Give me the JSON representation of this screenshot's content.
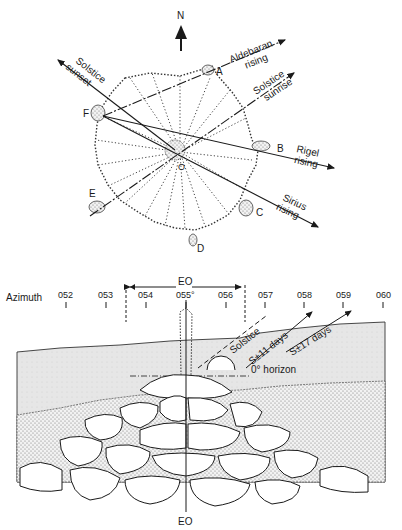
{
  "plan": {
    "north_label": "N",
    "center_label": "O",
    "stones": [
      {
        "id": "A",
        "label": "A"
      },
      {
        "id": "B",
        "label": "B"
      },
      {
        "id": "C",
        "label": "C"
      },
      {
        "id": "D",
        "label": "D"
      },
      {
        "id": "E",
        "label": "E"
      },
      {
        "id": "F",
        "label": "F"
      }
    ],
    "alignments": [
      {
        "name": "aldebaran",
        "line1": "Aldebaran",
        "line2": "rising"
      },
      {
        "name": "solstice-sunrise",
        "line1": "Solstice",
        "line2": "sunrise"
      },
      {
        "name": "solstice-sunset",
        "line1": "Solstice",
        "line2": "sunset"
      },
      {
        "name": "rigel",
        "line1": "Rigel",
        "line2": "rising"
      },
      {
        "name": "sirius",
        "line1": "Sirius",
        "line2": "rising"
      }
    ]
  },
  "elevation": {
    "top_label": "EO",
    "bottom_label": "EO",
    "azimuth_label": "Azimuth",
    "ticks": [
      "052",
      "053",
      "054",
      "055°",
      "056",
      "057",
      "058",
      "059",
      "060"
    ],
    "sun_paths": [
      "Solstice",
      "S±11 days",
      "S±17 days"
    ],
    "horizon_label": "0° horizon"
  }
}
